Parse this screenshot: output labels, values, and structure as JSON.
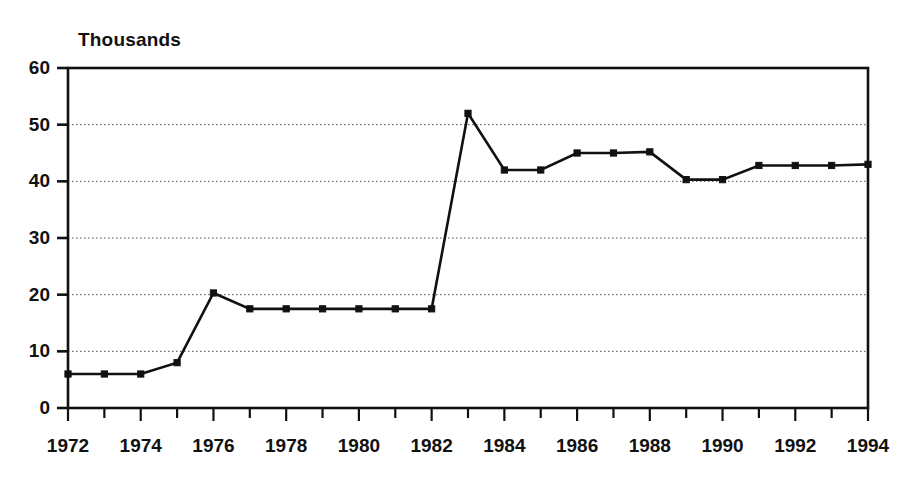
{
  "chart_data": {
    "type": "line",
    "title": "",
    "unit_label": "Thousands",
    "xlabel": "",
    "ylabel": "Thousands",
    "x": [
      1972,
      1973,
      1974,
      1975,
      1976,
      1977,
      1978,
      1979,
      1980,
      1981,
      1982,
      1983,
      1984,
      1985,
      1986,
      1987,
      1988,
      1989,
      1990,
      1991,
      1992,
      1993,
      1994
    ],
    "values": [
      6,
      6,
      6,
      8,
      20.3,
      17.5,
      17.5,
      17.5,
      17.5,
      17.5,
      17.5,
      52,
      42,
      42,
      45,
      45,
      45.2,
      40.3,
      40.3,
      42.8,
      42.8,
      42.8,
      43
    ],
    "series": [
      {
        "name": "Thousands",
        "values": [
          6,
          6,
          6,
          8,
          20.3,
          17.5,
          17.5,
          17.5,
          17.5,
          17.5,
          17.5,
          52,
          42,
          42,
          45,
          45,
          45.2,
          40.3,
          40.3,
          42.8,
          42.8,
          42.8,
          43
        ]
      }
    ],
    "xlim": [
      1972,
      1994
    ],
    "ylim": [
      0,
      60
    ],
    "ytick_labels": [
      "0",
      "10",
      "20",
      "30",
      "40",
      "50",
      "60"
    ],
    "ytick_values": [
      0,
      10,
      20,
      30,
      40,
      50,
      60
    ],
    "xtick_labels": [
      "1972",
      "1974",
      "1976",
      "1978",
      "1980",
      "1982",
      "1984",
      "1986",
      "1988",
      "1990",
      "1992",
      "1994"
    ],
    "xtick_values": [
      1972,
      1974,
      1976,
      1978,
      1980,
      1982,
      1984,
      1986,
      1988,
      1990,
      1992,
      1994
    ],
    "x_minor_ticks": [
      1972,
      1973,
      1974,
      1975,
      1976,
      1977,
      1978,
      1979,
      1980,
      1981,
      1982,
      1983,
      1984,
      1985,
      1986,
      1987,
      1988,
      1989,
      1990,
      1991,
      1992,
      1993,
      1994
    ],
    "grid": true,
    "grid_style": "dotted-horizontal",
    "legend": "none",
    "line_color": "#111111",
    "marker": "square",
    "background_color": "#ffffff"
  }
}
